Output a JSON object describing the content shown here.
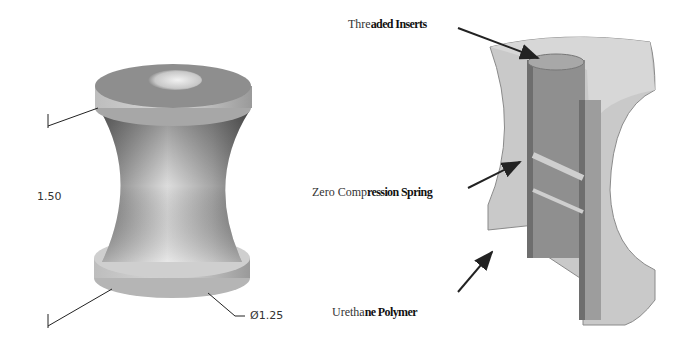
{
  "left_figure": {
    "name": "spool-isometric-view",
    "dimensions": {
      "height": "1.50",
      "diameter": "Ø1.25"
    }
  },
  "right_figure": {
    "name": "spool-section-cutaway",
    "callouts": [
      {
        "id": "threaded-inserts",
        "label_plain": "Thre",
        "label_bold": "aded Inserts",
        "full": "Threaded Inserts"
      },
      {
        "id": "zero-compression-spring",
        "label_plain": "Zero Comp",
        "label_bold": "ression Spring",
        "full": "Zero Compression Spring"
      },
      {
        "id": "urethane-polymer",
        "label_plain": "Uretha",
        "label_bold": "ne Polymer",
        "full": "Urethane Polymer"
      }
    ]
  },
  "colors": {
    "line": "#222222",
    "body_light": "#e6e6e6",
    "body_mid": "#a8a8a8",
    "body_dark": "#6e6e6e",
    "section_outer": "#c4c4c4",
    "section_inner": "#8a8a8a"
  }
}
